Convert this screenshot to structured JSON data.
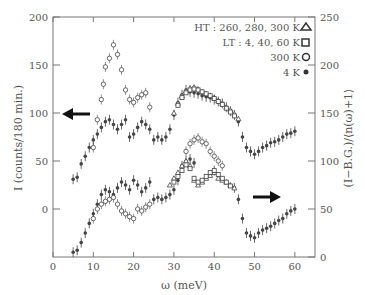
{
  "chart_data": {
    "type": "scatter",
    "title": "",
    "xlabel": "ω (meV)",
    "ylabel_left": "I (counts/180 min.)",
    "ylabel_right": "(I−B.G.)/⟨n(ω)+1⟩",
    "xlim": [
      0,
      65
    ],
    "ylim_left": [
      -50,
      200
    ],
    "ylim_right": [
      0,
      250
    ],
    "xticks": [
      0,
      10,
      20,
      30,
      40,
      50,
      60
    ],
    "yticks_left": [
      0,
      50,
      100,
      150,
      200
    ],
    "yticks_right": [
      0,
      50,
      100,
      150,
      200,
      250
    ],
    "grid": false,
    "legend": {
      "position": "upper right",
      "entries": [
        {
          "label": "HT : 260, 280, 300 K",
          "marker": "triangle-open"
        },
        {
          "label": "LT : 4, 40, 60 K",
          "marker": "square-open"
        },
        {
          "label": "300 K",
          "marker": "circle-open"
        },
        {
          "label": "4 K",
          "marker": "circle-filled"
        }
      ]
    },
    "annotations": [
      {
        "type": "arrow",
        "direction": "left",
        "meaning": "upper data use left axis"
      },
      {
        "type": "arrow",
        "direction": "right",
        "meaning": "lower data use right axis"
      }
    ],
    "series": [
      {
        "name": "4 K (upper, left axis)",
        "axis": "left",
        "marker": "circle-filled",
        "x": [
          5,
          6,
          7,
          8,
          9,
          10,
          11,
          12,
          13,
          14,
          15,
          16,
          17,
          18,
          19,
          20,
          21,
          22,
          23,
          24,
          25,
          26,
          27,
          28,
          29,
          30,
          31,
          32,
          33,
          34,
          35,
          36,
          37,
          38,
          39,
          40,
          41,
          42,
          43,
          44,
          45,
          46,
          47,
          48,
          49,
          50,
          51,
          52,
          53,
          54,
          55,
          56,
          57,
          58,
          59,
          60
        ],
        "y": [
          31,
          33,
          47,
          55,
          64,
          72,
          78,
          85,
          91,
          93,
          88,
          83,
          88,
          93,
          75,
          78,
          85,
          91,
          88,
          83,
          72,
          75,
          72,
          75,
          83,
          98,
          111,
          119,
          124,
          122,
          121,
          120,
          118,
          117,
          116,
          114,
          112,
          110,
          106,
          102,
          98,
          91,
          75,
          64,
          60,
          57,
          60,
          64,
          66,
          69,
          70,
          72,
          75,
          78,
          79,
          81
        ]
      },
      {
        "name": "300 K (upper, left axis)",
        "axis": "left",
        "marker": "circle-open",
        "x": [
          10,
          11,
          12,
          12.5,
          13,
          14,
          15,
          16,
          17,
          18,
          19,
          20,
          21,
          22,
          23,
          24
        ],
        "y": [
          64,
          93,
          114,
          130,
          148,
          157,
          171,
          161,
          145,
          124,
          114,
          111,
          116,
          119,
          121,
          106
        ]
      },
      {
        "name": "HT (upper, left axis)",
        "axis": "left",
        "marker": "triangle-open",
        "x": [
          30,
          31,
          32,
          33,
          34,
          35,
          36,
          37,
          38,
          39,
          40,
          41,
          42,
          43,
          44,
          45,
          46
        ],
        "y": [
          100,
          110,
          118,
          123,
          126,
          127,
          125,
          122,
          120,
          118,
          116,
          113,
          110,
          106,
          103,
          99,
          94
        ]
      },
      {
        "name": "LT (upper, left axis)",
        "axis": "left",
        "marker": "square-open",
        "x": [
          31,
          32,
          33,
          34,
          35,
          36,
          37,
          38,
          39,
          40,
          41,
          42,
          43,
          44,
          45
        ],
        "y": [
          108,
          116,
          121,
          124,
          125,
          124,
          122,
          120,
          118,
          115,
          112,
          109,
          105,
          101,
          97
        ]
      },
      {
        "name": "4 K (lower, right axis)",
        "axis": "right",
        "marker": "circle-filled",
        "x": [
          5,
          6,
          7,
          8,
          9,
          10,
          11,
          12,
          13,
          14,
          15,
          16,
          17,
          18,
          19,
          20,
          21,
          22,
          23,
          24,
          25,
          26,
          27,
          28,
          29,
          30,
          31,
          32,
          33,
          34,
          35,
          40,
          45,
          46,
          47,
          48,
          49,
          50,
          51,
          52,
          53,
          54,
          55,
          56,
          57,
          58,
          59,
          60
        ],
        "y": [
          5,
          7,
          15,
          25,
          35,
          45,
          55,
          65,
          70,
          68,
          65,
          72,
          78,
          75,
          70,
          80,
          75,
          68,
          72,
          78,
          60,
          62,
          60,
          62,
          65,
          70,
          80,
          95,
          100,
          102,
          98,
          90,
          72,
          60,
          40,
          25,
          22,
          20,
          25,
          28,
          30,
          32,
          35,
          38,
          40,
          45,
          48,
          50
        ]
      },
      {
        "name": "300 K (lower, right axis)",
        "axis": "right",
        "marker": "circle-open",
        "x": [
          10,
          11,
          12,
          13,
          14,
          15,
          16,
          17,
          18,
          19,
          20,
          21,
          22,
          23,
          24,
          33,
          34,
          35,
          36,
          37,
          38,
          39,
          40,
          41,
          42
        ],
        "y": [
          40,
          50,
          55,
          58,
          60,
          62,
          55,
          48,
          45,
          42,
          40,
          50,
          48,
          52,
          55,
          110,
          118,
          122,
          124,
          120,
          118,
          110,
          105,
          100,
          95
        ]
      },
      {
        "name": "HT (lower, right axis)",
        "axis": "right",
        "marker": "triangle-open",
        "x": [
          29,
          30,
          31,
          32,
          33,
          34,
          35,
          36,
          37,
          38,
          39,
          40,
          41,
          42,
          43,
          44,
          45
        ],
        "y": [
          75,
          82,
          88,
          95,
          100,
          95,
          80,
          75,
          78,
          82,
          85,
          88,
          82,
          80,
          78,
          75,
          72
        ]
      },
      {
        "name": "LT (lower, right axis)",
        "axis": "right",
        "marker": "square-open",
        "x": [
          30,
          31,
          32,
          33,
          34,
          35,
          36,
          37,
          38,
          39,
          40,
          41,
          42,
          43,
          44
        ],
        "y": [
          78,
          84,
          90,
          96,
          92,
          82,
          78,
          80,
          84,
          88,
          90,
          86,
          82,
          78,
          74
        ]
      }
    ]
  }
}
